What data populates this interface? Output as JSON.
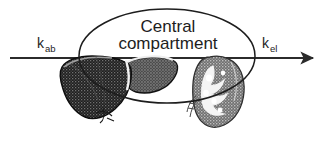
{
  "figure": {
    "type": "pharmacokinetic-compartment-diagram",
    "background_color": "#ffffff",
    "width": 322,
    "height": 144
  },
  "compartment": {
    "name_line1": "Central",
    "name_line2": "compartment",
    "shape": "ellipse",
    "outline_color": "#1d1d1d"
  },
  "flow": {
    "axis_color": "#2b2b2b",
    "inlet": {
      "symbol_base": "k",
      "symbol_subscript": "ab",
      "meaning": "absorption rate constant"
    },
    "outlet": {
      "symbol_base": "k",
      "symbol_subscript": "el",
      "meaning": "elimination rate constant"
    }
  },
  "organs": [
    {
      "name": "liver",
      "fill_dark": "#2a2a2a",
      "fill_mid": "#6b6b6b",
      "outline_color": "#111111"
    },
    {
      "name": "kidney",
      "fill_dark": "#7d7d7d",
      "fill_mid": "#a8a8a8",
      "outline_color": "#333333"
    }
  ]
}
